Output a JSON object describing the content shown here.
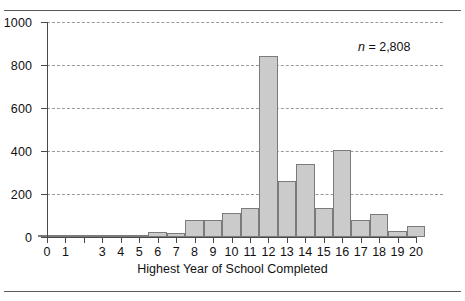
{
  "figure": {
    "annotation_prefix": "n",
    "annotation_suffix": " = 2,808",
    "axis_title": "Highest Year of School Completed"
  },
  "chart_data": {
    "type": "bar",
    "title": "",
    "subtitle": "",
    "xlabel": "Highest Year of School Completed",
    "ylabel": "",
    "xlim": [
      0,
      20
    ],
    "ylim": [
      0,
      1000
    ],
    "ytick_values": [
      0,
      200,
      400,
      600,
      800,
      1000
    ],
    "ytick_labels": [
      "0",
      "200",
      "400",
      "600",
      "800",
      "1000"
    ],
    "grid": "horizontal-dashed",
    "legend": "none",
    "annotations": [
      "n = 2,808"
    ],
    "sample_size": 2808,
    "categories": [
      "0",
      "1",
      "2",
      "3",
      "4",
      "5",
      "6",
      "7",
      "8",
      "9",
      "10",
      "11",
      "12",
      "13",
      "14",
      "15",
      "16",
      "17",
      "18",
      "19",
      "20"
    ],
    "xtick_labels": [
      "0",
      "1",
      "",
      "3",
      "4",
      "5",
      "6",
      "7",
      "8",
      "9",
      "10",
      "11",
      "12",
      "13",
      "14",
      "15",
      "16",
      "17",
      "18",
      "19",
      "20"
    ],
    "values": [
      2,
      5,
      4,
      10,
      8,
      8,
      25,
      20,
      80,
      78,
      110,
      135,
      840,
      260,
      340,
      135,
      405,
      78,
      105,
      28,
      52
    ],
    "bar_fill": "#cbcbcb",
    "bar_edge": "#7b7b7b",
    "axis_color": "#4a4a4a",
    "grid_color": "#9a9a9a"
  }
}
